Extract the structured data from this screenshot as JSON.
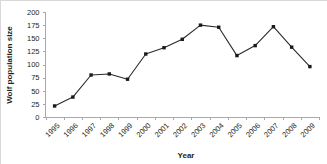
{
  "chart_data": {
    "type": "line",
    "title": "",
    "xlabel": "Year",
    "ylabel": "Wolf population size",
    "categories": [
      "1995",
      "1996",
      "1997",
      "1998",
      "1999",
      "2000",
      "2001",
      "2002",
      "2003",
      "2004",
      "2005",
      "2006",
      "2007",
      "2008",
      "2009"
    ],
    "values": [
      21,
      38,
      80,
      82,
      72,
      120,
      132,
      148,
      175,
      171,
      117,
      136,
      172,
      133,
      96
    ],
    "series": [
      {
        "name": "Wolf population size",
        "values": [
          21,
          38,
          80,
          82,
          72,
          120,
          132,
          148,
          175,
          171,
          117,
          136,
          172,
          133,
          96
        ]
      }
    ],
    "ylim": [
      0,
      200
    ],
    "yticks": [
      0,
      25,
      50,
      75,
      100,
      125,
      150,
      175,
      200
    ],
    "ytick_labels": [
      "0",
      "25",
      "50",
      "75",
      "100",
      "125",
      "150",
      "175",
      "200"
    ],
    "grid": false,
    "legend": false,
    "legend_position": "none",
    "marker": "square",
    "line_color": "#2b2b2b",
    "marker_color": "#1a1a1a",
    "background_color": "#ffffff",
    "axis_color": "#a9a9a9",
    "xtick_label_rotation": -45
  }
}
